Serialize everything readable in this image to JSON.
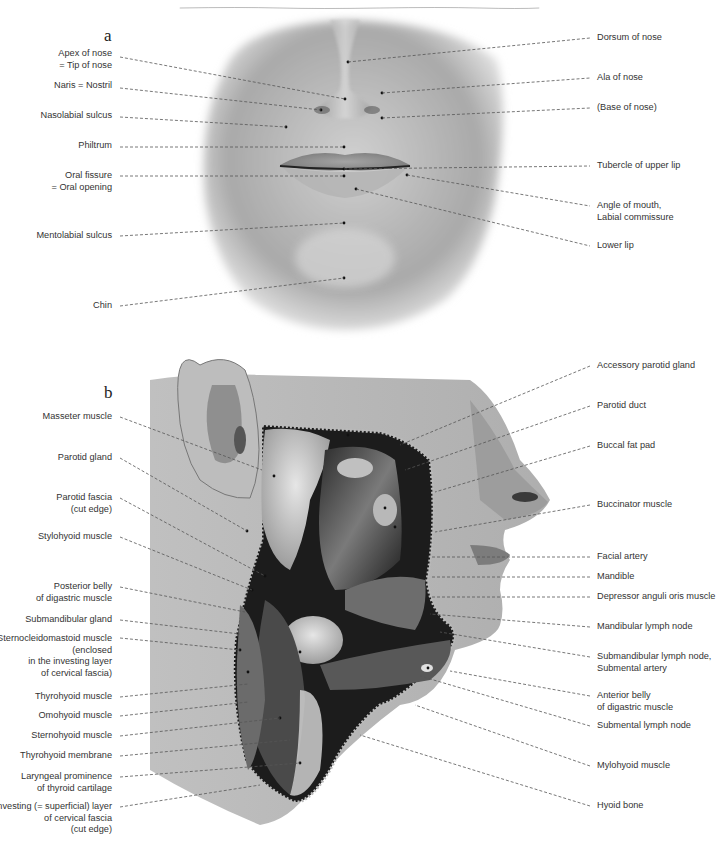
{
  "figure": {
    "panels": [
      {
        "letter": "a",
        "description": "Frontal view of the lower face: nose, lips and chin",
        "labels_left": [
          {
            "lines": [
              "Apex of nose",
              "= Tip of nose"
            ]
          },
          {
            "lines": [
              "Naris = Nostril"
            ]
          },
          {
            "lines": [
              "Nasolabial sulcus"
            ]
          },
          {
            "lines": [
              "Philtrum"
            ]
          },
          {
            "lines": [
              "Oral fissure",
              "= Oral opening"
            ]
          },
          {
            "lines": [
              "Mentolabial sulcus"
            ]
          },
          {
            "lines": [
              "Chin"
            ]
          }
        ],
        "labels_right": [
          {
            "lines": [
              "Dorsum of nose"
            ]
          },
          {
            "lines": [
              "Ala of nose"
            ]
          },
          {
            "lines": [
              "(Base of nose)"
            ]
          },
          {
            "lines": [
              "Tubercle of upper lip"
            ]
          },
          {
            "lines": [
              "Angle of mouth,",
              "Labial commissure"
            ]
          },
          {
            "lines": [
              "Lower lip"
            ]
          }
        ]
      },
      {
        "letter": "b",
        "description": "Lateral view of the face and neck with parotid region and submandibular triangle dissected",
        "labels_left": [
          {
            "lines": [
              "Masseter muscle"
            ]
          },
          {
            "lines": [
              "Parotid gland"
            ]
          },
          {
            "lines": [
              "Parotid fascia",
              "(cut edge)"
            ]
          },
          {
            "lines": [
              "Stylohyoid muscle"
            ]
          },
          {
            "lines": [
              "Posterior belly",
              "of digastric muscle"
            ]
          },
          {
            "lines": [
              "Submandibular gland"
            ]
          },
          {
            "lines": [
              "Sternocleidomastoid muscle",
              "(enclosed",
              "in the investing layer",
              "of cervical fascia)"
            ]
          },
          {
            "lines": [
              "Thyrohyoid muscle"
            ]
          },
          {
            "lines": [
              "Omohyoid muscle"
            ]
          },
          {
            "lines": [
              "Sternohyoid muscle"
            ]
          },
          {
            "lines": [
              "Thyrohyoid membrane"
            ]
          },
          {
            "lines": [
              "Laryngeal prominence",
              "of thyroid cartilage"
            ]
          },
          {
            "lines": [
              "Investing (= superficial) layer",
              "of cervical fascia",
              "(cut edge)"
            ]
          }
        ],
        "labels_right": [
          {
            "lines": [
              "Accessory parotid gland"
            ]
          },
          {
            "lines": [
              "Parotid duct"
            ]
          },
          {
            "lines": [
              "Buccal fat pad"
            ]
          },
          {
            "lines": [
              "Buccinator muscle"
            ]
          },
          {
            "lines": [
              "Facial artery"
            ]
          },
          {
            "lines": [
              "Mandible"
            ]
          },
          {
            "lines": [
              "Depressor anguli oris muscle"
            ]
          },
          {
            "lines": [
              "Mandibular lymph node"
            ]
          },
          {
            "lines": [
              "Submandibular lymph node,",
              "Submental artery"
            ]
          },
          {
            "lines": [
              "Anterior belly",
              "of digastric muscle"
            ]
          },
          {
            "lines": [
              "Submental lymph node"
            ]
          },
          {
            "lines": [
              "Mylohyoid muscle"
            ]
          },
          {
            "lines": [
              "Hyoid bone"
            ]
          }
        ]
      }
    ],
    "colors": {
      "label_text": "#333333",
      "leader_line": "#555555",
      "skin_light": "#d9d9d9",
      "skin_mid": "#9a9a9a",
      "skin_dark": "#4a4a4a",
      "dissection_dark": "#1c1c1c"
    }
  }
}
